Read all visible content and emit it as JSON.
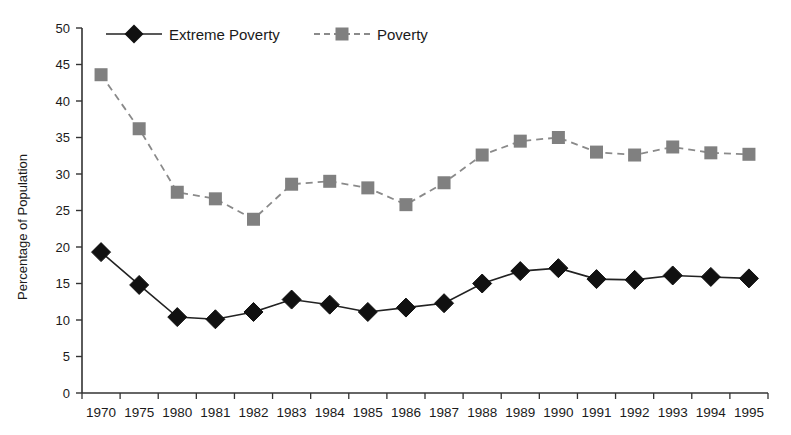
{
  "chart_data": {
    "type": "line",
    "title": "",
    "xlabel": "",
    "ylabel": "Percentage of Population",
    "ylim": [
      0,
      50
    ],
    "ytick_step": 5,
    "yticks": [
      "0",
      "5",
      "10",
      "15",
      "20",
      "25",
      "30",
      "35",
      "40",
      "45",
      "50"
    ],
    "grid": false,
    "legend_position": "top-left-inside",
    "categories": [
      "1970",
      "1975",
      "1980",
      "1981",
      "1982",
      "1983",
      "1984",
      "1985",
      "1986",
      "1987",
      "1988",
      "1989",
      "1990",
      "1991",
      "1992",
      "1993",
      "1994",
      "1995"
    ],
    "series": [
      {
        "name": "Extreme Poverty",
        "marker": "diamond",
        "marker_color": "#111111",
        "line_style": "solid",
        "line_color": "#222222",
        "values": [
          19.3,
          14.8,
          10.4,
          10.1,
          11.1,
          12.8,
          12.1,
          11.1,
          11.7,
          12.3,
          15.0,
          16.7,
          17.1,
          15.6,
          15.5,
          16.1,
          15.9,
          15.7
        ]
      },
      {
        "name": "Poverty",
        "marker": "square",
        "marker_color": "#808080",
        "line_style": "dashed",
        "line_color": "#8a8a8a",
        "values": [
          43.6,
          36.2,
          27.5,
          26.6,
          23.8,
          28.6,
          29.0,
          28.1,
          25.8,
          28.8,
          32.6,
          34.5,
          35.0,
          33.0,
          32.6,
          33.7,
          32.9,
          32.7
        ]
      }
    ]
  },
  "legend": {
    "items": [
      {
        "label": "Extreme Poverty"
      },
      {
        "label": "Poverty"
      }
    ]
  },
  "axes": {
    "y_title": "Percentage of Population"
  },
  "colors": {
    "extreme_poverty": "#111111",
    "poverty": "#808080",
    "axis": "#333333",
    "background": "#ffffff"
  }
}
